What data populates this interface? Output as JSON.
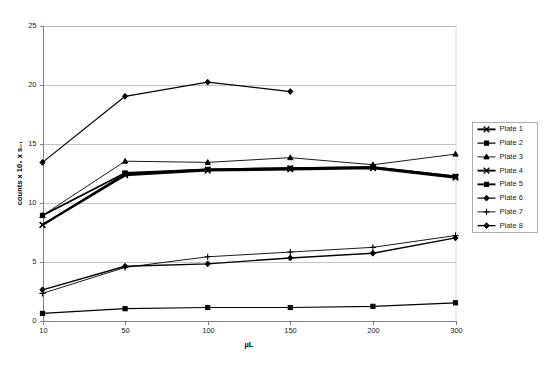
{
  "chart_data": {
    "type": "line",
    "title": "",
    "xlabel": "µL",
    "ylabel": "counts x 10₃ x s₋₁",
    "categories": [
      "10",
      "50",
      "100",
      "150",
      "200",
      "300"
    ],
    "ylim": [
      0,
      25
    ],
    "yticks": [
      0,
      5,
      10,
      15,
      20,
      25
    ],
    "grid": true,
    "legend_position": "right",
    "series": [
      {
        "name": "Plate 1",
        "marker": "cross-x",
        "values": [
          8.1,
          12.3,
          12.7,
          12.8,
          12.9,
          12.1
        ]
      },
      {
        "name": "Plate 2",
        "marker": "square-filled",
        "values": [
          0.6,
          1.0,
          1.1,
          1.1,
          1.2,
          1.5
        ]
      },
      {
        "name": "Plate 3",
        "marker": "triangle-filled",
        "values": [
          8.9,
          13.5,
          13.4,
          13.8,
          13.2,
          14.1
        ]
      },
      {
        "name": "Plate 4",
        "marker": "cross-x",
        "values": [
          8.1,
          12.4,
          12.8,
          12.9,
          13.0,
          12.2
        ]
      },
      {
        "name": "Plate 5",
        "marker": "square-filled",
        "values": [
          8.9,
          12.5,
          12.8,
          12.9,
          13.0,
          12.2
        ]
      },
      {
        "name": "Plate 6",
        "marker": "diamond-filled",
        "values": [
          13.4,
          19.0,
          20.2,
          19.4,
          null,
          null
        ]
      },
      {
        "name": "Plate 7",
        "marker": "plus",
        "values": [
          2.3,
          4.5,
          5.4,
          5.8,
          6.2,
          7.2
        ]
      },
      {
        "name": "Plate 8",
        "marker": "diamond-filled",
        "values": [
          2.6,
          4.6,
          4.8,
          5.3,
          5.7,
          7.0
        ]
      }
    ]
  },
  "legend": {
    "items": [
      {
        "label": "Plate 1"
      },
      {
        "label": "Plate 2"
      },
      {
        "label": "Plate 3"
      },
      {
        "label": "Plate 4"
      },
      {
        "label": "Plate 5"
      },
      {
        "label": "Plate 6"
      },
      {
        "label": "Plate 7"
      },
      {
        "label": "Plate 8"
      }
    ]
  },
  "colors": {
    "series": "#000000",
    "grid": "#a9a9a9",
    "axis": "#808080",
    "background": "#ffffff"
  }
}
